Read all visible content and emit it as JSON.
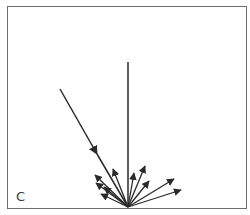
{
  "diagram": {
    "type": "light-reflection",
    "panel_label": "C",
    "line_color": "#2a2a2a",
    "frame_color": "#6e6e6e",
    "normal": {
      "description": "surface normal (vertical line)"
    },
    "incident_ray": {
      "description": "incoming ray with arrow pointing toward surface"
    },
    "reflected_rays": [
      {
        "id": "r1",
        "side": "left"
      },
      {
        "id": "r2",
        "side": "left"
      },
      {
        "id": "r3",
        "side": "left"
      },
      {
        "id": "r4",
        "side": "left"
      },
      {
        "id": "r5",
        "side": "left"
      },
      {
        "id": "r6",
        "side": "right"
      },
      {
        "id": "r7",
        "side": "right"
      },
      {
        "id": "r8",
        "side": "right"
      },
      {
        "id": "r9",
        "side": "right"
      },
      {
        "id": "r10",
        "side": "right"
      }
    ]
  }
}
